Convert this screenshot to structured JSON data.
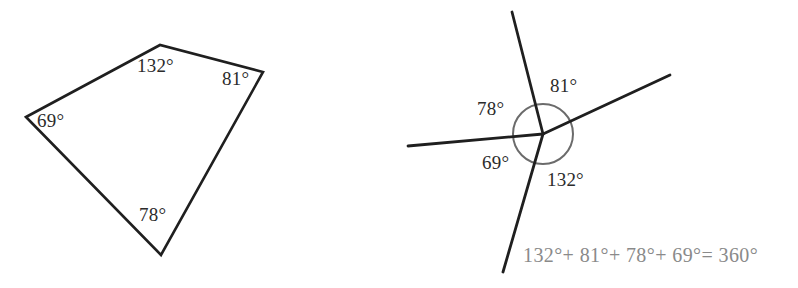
{
  "figure": {
    "caption": "",
    "stroke_color": "#1f1f1f",
    "circle_color": "#6b6b6b",
    "label_color": "#2b2b2b",
    "equation_color": "#8a8a8a",
    "background": "#ffffff"
  },
  "quadrilateral": {
    "name": "quadrilateral-interior-angles",
    "vertices": [
      {
        "id": "left",
        "x": 26,
        "y": 117
      },
      {
        "id": "top",
        "x": 160,
        "y": 45
      },
      {
        "id": "right",
        "x": 263,
        "y": 72
      },
      {
        "id": "bottom",
        "x": 161,
        "y": 255
      }
    ],
    "path": "M 26,117 L 160,45 L 263,72 L 161,255 Z",
    "angle_labels": [
      {
        "id": "top",
        "text": "132°"
      },
      {
        "id": "right",
        "text": "81°"
      },
      {
        "id": "left",
        "text": "69°"
      },
      {
        "id": "bottom",
        "text": "78°"
      }
    ]
  },
  "rays": {
    "name": "exterior-angle-rotation",
    "center": {
      "x": 543,
      "y": 134
    },
    "circle_radius": 30,
    "segments": [
      {
        "id": "ray-up",
        "x1": 543,
        "y1": 134,
        "x2": 512,
        "y2": 12
      },
      {
        "id": "ray-upper-right",
        "x1": 543,
        "y1": 134,
        "x2": 670,
        "y2": 75
      },
      {
        "id": "ray-left",
        "x1": 543,
        "y1": 134,
        "x2": 408,
        "y2": 146
      },
      {
        "id": "ray-lower-left",
        "x1": 543,
        "y1": 134,
        "x2": 503,
        "y2": 272
      }
    ],
    "angle_labels": [
      {
        "id": "between-left-and-up",
        "text": "78°"
      },
      {
        "id": "between-up-and-upper-right",
        "text": "81°"
      },
      {
        "id": "between-lower-left-and-left",
        "text": "69°"
      },
      {
        "id": "between-upper-right-and-lower-left",
        "text": "132°"
      }
    ],
    "equation": "132°+ 81°+ 78°+ 69°= 360°"
  },
  "chart_data": {
    "type": "diagram",
    "title": "",
    "panels": [
      {
        "name": "quadrilateral",
        "description": "Quadrilateral with labelled interior angles",
        "angles_deg": [
          132,
          81,
          69,
          78
        ],
        "angle_labels": [
          "132°",
          "81°",
          "69°",
          "78°"
        ]
      },
      {
        "name": "angles-around-a-point",
        "description": "Four rays from one point with a circle showing the four angles summing to 360 degrees",
        "angles_deg": [
          132,
          81,
          78,
          69
        ],
        "angle_labels": [
          "78°",
          "81°",
          "69°",
          "132°"
        ],
        "sum_deg": 360,
        "equation": "132°+ 81°+ 78°+ 69°= 360°"
      }
    ]
  }
}
